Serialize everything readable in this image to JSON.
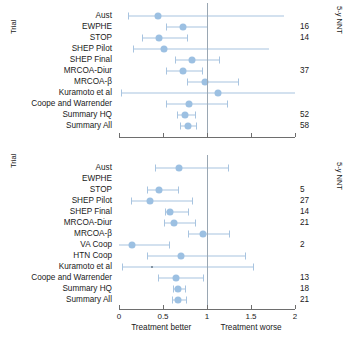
{
  "chart_data": [
    {
      "id": "panel-top",
      "type": "forest",
      "ylabel": "Trial",
      "right_axis_label": "5-y NNT",
      "xlabel_left": "",
      "xlabel_right": "",
      "xlim": [
        0,
        2
      ],
      "xticks": [
        0,
        0.5,
        1,
        1.5,
        2
      ],
      "xticklabels": [
        "0",
        "0.5",
        "1",
        "1.5",
        "2"
      ],
      "show_xticklabels": false,
      "null_value": 1,
      "grid": false,
      "rows": [
        {
          "label": "Aust",
          "estimate": 0.44,
          "low": 0.1,
          "high": 1.87,
          "low_capped": true,
          "high_capped": false,
          "nnt": ""
        },
        {
          "label": "EWPHE",
          "estimate": 0.73,
          "low": 0.53,
          "high": 1.0,
          "low_capped": true,
          "high_capped": true,
          "nnt": "16"
        },
        {
          "label": "STOP",
          "estimate": 0.45,
          "low": 0.26,
          "high": 0.77,
          "low_capped": true,
          "high_capped": true,
          "nnt": "14"
        },
        {
          "label": "SHEP Pilot",
          "estimate": 0.51,
          "low": 0.16,
          "high": 1.7,
          "low_capped": true,
          "high_capped": false,
          "nnt": ""
        },
        {
          "label": "SHEP Final",
          "estimate": 0.83,
          "low": 0.64,
          "high": 1.14,
          "low_capped": true,
          "high_capped": true,
          "nnt": ""
        },
        {
          "label": "MRCOA-Diur",
          "estimate": 0.73,
          "low": 0.53,
          "high": 0.94,
          "low_capped": true,
          "high_capped": true,
          "nnt": "37"
        },
        {
          "label": "MRCOA-β",
          "estimate": 0.98,
          "low": 0.77,
          "high": 1.35,
          "low_capped": true,
          "high_capped": true,
          "nnt": ""
        },
        {
          "label": "Kuramoto et al",
          "estimate": 1.13,
          "low": 0.02,
          "high": 2.0,
          "low_capped": true,
          "high_capped": false,
          "nnt": ""
        },
        {
          "label": "Coope and Warrender",
          "estimate": 0.79,
          "low": 0.53,
          "high": 1.23,
          "low_capped": true,
          "high_capped": true,
          "nnt": ""
        },
        {
          "label": "Summary HQ",
          "estimate": 0.75,
          "low": 0.66,
          "high": 0.86,
          "low_capped": true,
          "high_capped": true,
          "nnt": "52"
        },
        {
          "label": "Summary All",
          "estimate": 0.78,
          "low": 0.69,
          "high": 0.88,
          "low_capped": true,
          "high_capped": true,
          "nnt": "58"
        }
      ]
    },
    {
      "id": "panel-bottom",
      "type": "forest",
      "ylabel": "Trial",
      "right_axis_label": "5-y NNT",
      "xlabel_left": "Treatment better",
      "xlabel_right": "Treatment worse",
      "xlim": [
        0,
        2
      ],
      "xticks": [
        0,
        0.5,
        1,
        1.5,
        2
      ],
      "xticklabels": [
        "0",
        "0.5",
        "1",
        "1.5",
        "2"
      ],
      "show_xticklabels": true,
      "null_value": 1,
      "grid": false,
      "rows": [
        {
          "label": "Aust",
          "estimate": 0.68,
          "low": 0.41,
          "high": 1.24,
          "low_capped": true,
          "high_capped": true,
          "nnt": ""
        },
        {
          "label": "EWPHE",
          "estimate": null,
          "low": null,
          "high": null,
          "low_capped": false,
          "high_capped": false,
          "nnt": ""
        },
        {
          "label": "STOP",
          "estimate": 0.45,
          "low": 0.32,
          "high": 0.67,
          "low_capped": true,
          "high_capped": true,
          "nnt": "5"
        },
        {
          "label": "SHEP Pilot",
          "estimate": 0.35,
          "low": 0.14,
          "high": 0.83,
          "low_capped": true,
          "high_capped": true,
          "nnt": "27"
        },
        {
          "label": "SHEP Final",
          "estimate": 0.58,
          "low": 0.52,
          "high": 0.78,
          "low_capped": true,
          "high_capped": true,
          "nnt": "14"
        },
        {
          "label": "MRCOA-Diur",
          "estimate": 0.62,
          "low": 0.51,
          "high": 0.86,
          "low_capped": true,
          "high_capped": true,
          "nnt": "21"
        },
        {
          "label": "MRCOA-β",
          "estimate": 0.96,
          "low": 0.78,
          "high": 1.25,
          "low_capped": true,
          "high_capped": true,
          "nnt": ""
        },
        {
          "label": "VA Coop",
          "estimate": 0.15,
          "low": 0.0,
          "high": 0.57,
          "low_capped": false,
          "high_capped": true,
          "nnt": "2"
        },
        {
          "label": "HTN Coop",
          "estimate": 0.7,
          "low": 0.32,
          "high": 1.43,
          "low_capped": true,
          "high_capped": true,
          "nnt": ""
        },
        {
          "label": "Kuramoto et al",
          "estimate": 0.37,
          "low": 0.03,
          "high": 1.52,
          "low_capped": true,
          "high_capped": true,
          "marker": "tiny",
          "nnt": ""
        },
        {
          "label": "Coope and Warrender",
          "estimate": 0.65,
          "low": 0.44,
          "high": 0.96,
          "low_capped": true,
          "high_capped": true,
          "nnt": "13"
        },
        {
          "label": "Summary HQ",
          "estimate": 0.67,
          "low": 0.61,
          "high": 0.75,
          "low_capped": true,
          "high_capped": true,
          "nnt": "18"
        },
        {
          "label": "Summary All",
          "estimate": 0.67,
          "low": 0.6,
          "high": 0.76,
          "low_capped": true,
          "high_capped": true,
          "nnt": "21"
        }
      ]
    }
  ],
  "colors": {
    "marker": "#9cc0e2",
    "ci_line": "#a8c4e0",
    "null_line": "#9aa7b3",
    "axis": "#6e6e6e",
    "text": "#1a1a1a"
  }
}
